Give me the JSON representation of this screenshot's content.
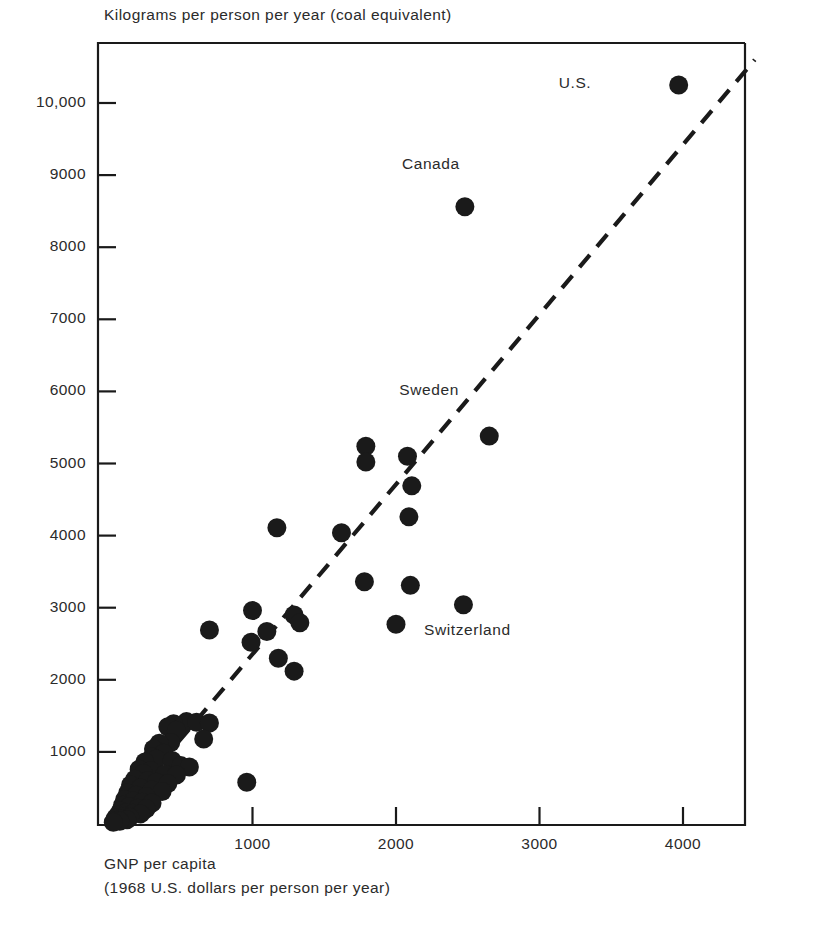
{
  "chart_data": {
    "type": "scatter",
    "title": "",
    "ylabel": "Kilograms per person per year (coal equivalent)",
    "xlabel_line1": "GNP per capita",
    "xlabel_line2": "(1968 U.S. dollars per person per year)",
    "xlim": [
      0,
      4450
    ],
    "ylim": [
      0,
      10850
    ],
    "grid": false,
    "legend": "none",
    "xticks": [
      {
        "value": 1000,
        "label": "1000"
      },
      {
        "value": 2000,
        "label": "2000"
      },
      {
        "value": 3000,
        "label": "3000"
      },
      {
        "value": 4000,
        "label": "4000"
      }
    ],
    "yticks": [
      {
        "value": 1000,
        "label": "1000"
      },
      {
        "value": 2000,
        "label": "2000"
      },
      {
        "value": 3000,
        "label": "3000"
      },
      {
        "value": 4000,
        "label": "4000"
      },
      {
        "value": 5000,
        "label": "5000"
      },
      {
        "value": 6000,
        "label": "6000"
      },
      {
        "value": 7000,
        "label": "7000"
      },
      {
        "value": 8000,
        "label": "8000"
      },
      {
        "value": 9000,
        "label": "9000"
      },
      {
        "value": 10000,
        "label": "10,000"
      }
    ],
    "marker": {
      "shape": "circle",
      "color": "#1a1a1a",
      "radius_px": 9.5
    },
    "trendline": {
      "style": "dashed",
      "color": "#1a1a1a",
      "x_start": 0,
      "y_start": 0,
      "x_end": 4500,
      "y_end": 10600
    },
    "annotations": [
      {
        "text": "U.S.",
        "x": 3970,
        "y": 10250,
        "label_dx": -120,
        "label_dy": 0
      },
      {
        "text": "Canada",
        "x": 2480,
        "y": 8560,
        "label_dx": -34,
        "label_dy": -52
      },
      {
        "text": "Sweden",
        "x": 2650,
        "y": 5380,
        "label_dx": -60,
        "label_dy": -55
      },
      {
        "text": "Switzerland",
        "x": 2000,
        "y": 2770,
        "label_dx": 28,
        "label_dy": 8
      }
    ],
    "points": [
      {
        "x": 3970,
        "y": 10250
      },
      {
        "x": 2480,
        "y": 8560
      },
      {
        "x": 2650,
        "y": 5380
      },
      {
        "x": 1790,
        "y": 5240
      },
      {
        "x": 2080,
        "y": 5100
      },
      {
        "x": 1790,
        "y": 5020
      },
      {
        "x": 2110,
        "y": 4690
      },
      {
        "x": 2090,
        "y": 4260
      },
      {
        "x": 1170,
        "y": 4110
      },
      {
        "x": 1620,
        "y": 4040
      },
      {
        "x": 1780,
        "y": 3360
      },
      {
        "x": 2100,
        "y": 3310
      },
      {
        "x": 2470,
        "y": 3040
      },
      {
        "x": 1000,
        "y": 2960
      },
      {
        "x": 1290,
        "y": 2900
      },
      {
        "x": 1330,
        "y": 2790
      },
      {
        "x": 2000,
        "y": 2770
      },
      {
        "x": 1100,
        "y": 2670
      },
      {
        "x": 700,
        "y": 2690
      },
      {
        "x": 990,
        "y": 2520
      },
      {
        "x": 1180,
        "y": 2300
      },
      {
        "x": 1290,
        "y": 2120
      },
      {
        "x": 540,
        "y": 1420
      },
      {
        "x": 610,
        "y": 1410
      },
      {
        "x": 700,
        "y": 1400
      },
      {
        "x": 450,
        "y": 1390
      },
      {
        "x": 410,
        "y": 1350
      },
      {
        "x": 470,
        "y": 1300
      },
      {
        "x": 660,
        "y": 1180
      },
      {
        "x": 430,
        "y": 1130
      },
      {
        "x": 350,
        "y": 1120
      },
      {
        "x": 310,
        "y": 1040
      },
      {
        "x": 380,
        "y": 980
      },
      {
        "x": 300,
        "y": 930
      },
      {
        "x": 330,
        "y": 900
      },
      {
        "x": 440,
        "y": 880
      },
      {
        "x": 250,
        "y": 860
      },
      {
        "x": 500,
        "y": 810
      },
      {
        "x": 560,
        "y": 790
      },
      {
        "x": 210,
        "y": 760
      },
      {
        "x": 290,
        "y": 740
      },
      {
        "x": 240,
        "y": 700
      },
      {
        "x": 390,
        "y": 690
      },
      {
        "x": 470,
        "y": 680
      },
      {
        "x": 960,
        "y": 580
      },
      {
        "x": 180,
        "y": 620
      },
      {
        "x": 270,
        "y": 600
      },
      {
        "x": 330,
        "y": 580
      },
      {
        "x": 410,
        "y": 560
      },
      {
        "x": 150,
        "y": 540
      },
      {
        "x": 220,
        "y": 500
      },
      {
        "x": 300,
        "y": 470
      },
      {
        "x": 370,
        "y": 450
      },
      {
        "x": 130,
        "y": 430
      },
      {
        "x": 190,
        "y": 400
      },
      {
        "x": 260,
        "y": 380
      },
      {
        "x": 110,
        "y": 340
      },
      {
        "x": 170,
        "y": 320
      },
      {
        "x": 230,
        "y": 300
      },
      {
        "x": 300,
        "y": 290
      },
      {
        "x": 95,
        "y": 260
      },
      {
        "x": 140,
        "y": 240
      },
      {
        "x": 200,
        "y": 220
      },
      {
        "x": 260,
        "y": 210
      },
      {
        "x": 80,
        "y": 180
      },
      {
        "x": 120,
        "y": 160
      },
      {
        "x": 170,
        "y": 150
      },
      {
        "x": 220,
        "y": 140
      },
      {
        "x": 60,
        "y": 120
      },
      {
        "x": 100,
        "y": 105
      },
      {
        "x": 145,
        "y": 95
      },
      {
        "x": 45,
        "y": 80
      },
      {
        "x": 85,
        "y": 70
      },
      {
        "x": 125,
        "y": 60
      },
      {
        "x": 40,
        "y": 45
      },
      {
        "x": 75,
        "y": 38
      },
      {
        "x": 30,
        "y": 25
      }
    ]
  }
}
